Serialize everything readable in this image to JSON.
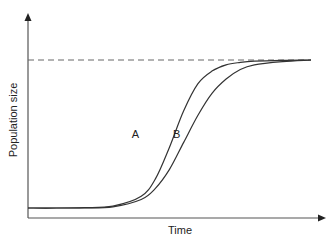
{
  "chart_data": {
    "type": "line",
    "title": "",
    "xlabel": "Time",
    "ylabel": "Population size",
    "xlim": [
      0,
      100
    ],
    "ylim": [
      0,
      1.07
    ],
    "grid": false,
    "legend": "none",
    "x_ticks": [],
    "y_ticks": [],
    "reference_lines": [
      {
        "name": "carrying-capacity",
        "orientation": "horizontal",
        "y": 1.0,
        "style": "dashed"
      }
    ],
    "series": [
      {
        "name": "A",
        "label": "A",
        "model": "logistic",
        "x": [
          0,
          10,
          20,
          30,
          40,
          45,
          50,
          55,
          60,
          65,
          70,
          75,
          80,
          90,
          100
        ],
        "values": [
          0.066,
          0.066,
          0.068,
          0.078,
          0.14,
          0.25,
          0.45,
          0.68,
          0.85,
          0.93,
          0.97,
          0.985,
          0.993,
          0.998,
          1.0
        ]
      },
      {
        "name": "B",
        "label": "B",
        "model": "logistic",
        "x": [
          0,
          10,
          20,
          30,
          40,
          45,
          50,
          55,
          60,
          65,
          70,
          75,
          80,
          90,
          100
        ],
        "values": [
          0.066,
          0.066,
          0.067,
          0.074,
          0.12,
          0.19,
          0.31,
          0.48,
          0.65,
          0.79,
          0.88,
          0.94,
          0.97,
          0.99,
          1.0
        ]
      }
    ],
    "annotations": [
      {
        "text": "A",
        "series": "A",
        "x": 38,
        "y": 0.53
      },
      {
        "text": "B",
        "series": "B",
        "x": 52.5,
        "y": 0.53
      }
    ]
  }
}
